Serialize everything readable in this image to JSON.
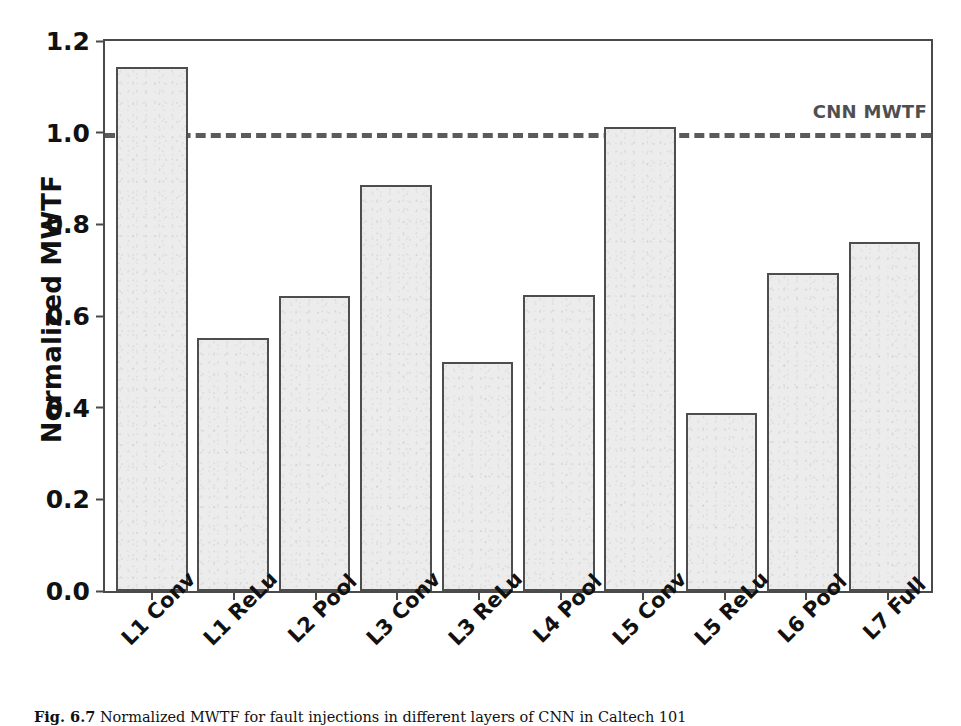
{
  "chart_data": {
    "type": "bar",
    "title": "",
    "xlabel": "",
    "ylabel": "Normalized MWTF",
    "categories": [
      "L1 Conv",
      "L1 ReLu",
      "L2 Pool",
      "L3 Conv",
      "L3 ReLu",
      "L4 Pool",
      "L5 Conv",
      "L5 ReLu",
      "L6 Pool",
      "L7 Full"
    ],
    "values": [
      1.143,
      0.553,
      0.643,
      0.885,
      0.5,
      0.645,
      1.013,
      0.388,
      0.694,
      0.762
    ],
    "ylim": [
      0.0,
      1.2
    ],
    "yticks": [
      "0.0",
      "0.2",
      "0.4",
      "0.6",
      "0.8",
      "1.0",
      "1.2"
    ],
    "ytick_values": [
      0.0,
      0.2,
      0.4,
      0.6,
      0.8,
      1.0,
      1.2
    ],
    "grid": false,
    "legend_position": "none",
    "annotations": [
      {
        "name": "reference-line",
        "label": "CNN MWTF",
        "value": 1.0,
        "style": "dashed",
        "color": "#5b5b5b"
      }
    ],
    "bar_fill_color": "#ececec",
    "bar_edge_color": "#4d4d4d",
    "axis_color": "#4a4a4a"
  },
  "caption": {
    "figure_number": "Fig. 6.7",
    "text": "Normalized MWTF for fault injections in different layers of CNN in Caltech 101"
  }
}
